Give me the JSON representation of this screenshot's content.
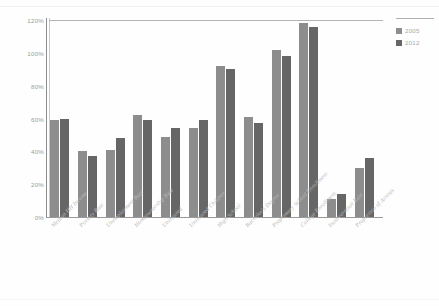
{
  "chart_data": {
    "type": "bar",
    "title": "",
    "xlabel": "",
    "ylabel": "",
    "ylim": [
      0,
      120
    ],
    "yticks": [
      "0%",
      "20%",
      "40%",
      "60%",
      "80%",
      "100%",
      "120%"
    ],
    "ytick_values": [
      0,
      20,
      40,
      60,
      80,
      100,
      120
    ],
    "grid": false,
    "legend_position": "right",
    "categories": [
      "Median HH Income",
      "Poverty Rate",
      "Unemployment Rate",
      "Homeownership Rate",
      "Uninsured",
      "Uninsured Children",
      "High School",
      "Bachelor's Degree",
      "Preprimary School Enrollment",
      "College Enrollment",
      "Incarceration Rate",
      "Proportion of Arrests"
    ],
    "series": [
      {
        "name": "2005",
        "color": "#8d8d8d",
        "values": [
          59,
          40,
          41,
          62,
          49,
          54,
          92,
          61,
          102,
          118,
          11,
          30
        ]
      },
      {
        "name": "2012",
        "color": "#666666",
        "values": [
          60,
          37,
          48,
          59,
          54,
          59,
          90,
          57,
          98,
          116,
          14,
          36
        ]
      }
    ]
  },
  "legend": {
    "entries": [
      {
        "label": "2005",
        "color": "#8d8d8d"
      },
      {
        "label": "2012",
        "color": "#666666"
      }
    ]
  },
  "colors": {
    "series_2005": "#8d8d8d",
    "series_2012": "#666666",
    "axis": "#9a9a9a",
    "tick_text": "#9b9b9b",
    "xlabel_text": "#b9b9b9",
    "background": "#fefefe"
  }
}
